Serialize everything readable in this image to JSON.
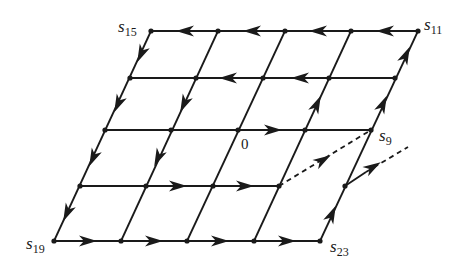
{
  "diagram": {
    "type": "lattice path diagram",
    "colors": {
      "stroke": "#1a1a1a",
      "background": "#ffffff"
    },
    "labels": {
      "s15": {
        "base": "s",
        "sub": "15"
      },
      "s11": {
        "base": "s",
        "sub": "11"
      },
      "s9": {
        "base": "s",
        "sub": "9"
      },
      "s19": {
        "base": "s",
        "sub": "19"
      },
      "s23": {
        "base": "s",
        "sub": "23"
      },
      "origin": "0"
    },
    "rows": [
      {
        "y": 31,
        "xs": [
          151,
          218,
          285,
          351,
          418
        ]
      },
      {
        "y": 78,
        "xs": [
          130,
          196,
          263,
          329,
          395
        ]
      },
      {
        "y": 130,
        "xs": [
          105,
          171,
          238,
          305,
          371
        ]
      },
      {
        "y": 186,
        "xs": [
          80,
          146,
          213,
          279,
          345
        ]
      },
      {
        "y": 241,
        "xs": [
          54,
          121,
          187,
          254,
          320
        ]
      }
    ],
    "solid_edges": [
      [
        151,
        31,
        418,
        31
      ],
      [
        130,
        78,
        395,
        78
      ],
      [
        105,
        130,
        371,
        130
      ],
      [
        80,
        186,
        279,
        186
      ],
      [
        54,
        241,
        320,
        241
      ],
      [
        151,
        31,
        54,
        241
      ],
      [
        218,
        31,
        121,
        241
      ],
      [
        285,
        31,
        187,
        241
      ],
      [
        351,
        31,
        254,
        241
      ],
      [
        418,
        31,
        320,
        241
      ],
      [
        345,
        186,
        366,
        172
      ]
    ],
    "dashed_edges": [
      [
        279,
        186,
        371,
        130
      ],
      [
        366,
        172,
        408,
        147
      ]
    ],
    "arrows": [
      {
        "x": 185,
        "y": 31,
        "dir": "left"
      },
      {
        "x": 252,
        "y": 31,
        "dir": "left"
      },
      {
        "x": 318,
        "y": 31,
        "dir": "left"
      },
      {
        "x": 385,
        "y": 31,
        "dir": "left"
      },
      {
        "x": 228,
        "y": 78,
        "dir": "left"
      },
      {
        "x": 300,
        "y": 78,
        "dir": "left"
      },
      {
        "x": 273,
        "y": 130,
        "dir": "right"
      },
      {
        "x": 178,
        "y": 186,
        "dir": "right"
      },
      {
        "x": 245,
        "y": 186,
        "dir": "right"
      },
      {
        "x": 88,
        "y": 241,
        "dir": "right"
      },
      {
        "x": 154,
        "y": 241,
        "dir": "right"
      },
      {
        "x": 220,
        "y": 241,
        "dir": "right"
      },
      {
        "x": 287,
        "y": 241,
        "dir": "right"
      },
      {
        "x": 141,
        "y": 54,
        "dir": "down-left"
      },
      {
        "x": 118,
        "y": 104,
        "dir": "down-left"
      },
      {
        "x": 93,
        "y": 158,
        "dir": "down-left"
      },
      {
        "x": 67,
        "y": 213,
        "dir": "down-left"
      },
      {
        "x": 184,
        "y": 104,
        "dir": "down-left"
      },
      {
        "x": 158,
        "y": 158,
        "dir": "down-left"
      },
      {
        "x": 317,
        "y": 104,
        "dir": "up-right"
      },
      {
        "x": 332,
        "y": 214,
        "dir": "up-right"
      },
      {
        "x": 383,
        "y": 104,
        "dir": "up-right"
      },
      {
        "x": 406,
        "y": 55,
        "dir": "up-right"
      },
      {
        "x": 323,
        "y": 160,
        "dir": "dash-right",
        "angle": -31
      },
      {
        "x": 373,
        "y": 167,
        "dir": "dash-right",
        "angle": -31
      }
    ]
  }
}
